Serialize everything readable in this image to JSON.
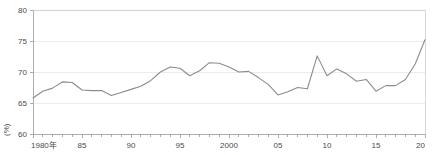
{
  "chart_data": {
    "type": "line",
    "title": "",
    "subtitle": "",
    "xlabel": "",
    "ylabel": "(%)",
    "ylim": [
      60,
      80
    ],
    "xlim": [
      1980,
      2020
    ],
    "grid": true,
    "legend": false,
    "legend_position": "none",
    "line_color": "#8c8c8c",
    "y_ticks": [
      60,
      65,
      70,
      75,
      80
    ],
    "y_tick_labels": [
      "60",
      "65",
      "70",
      "75",
      "80"
    ],
    "x_ticks": [
      1980,
      1985,
      1990,
      1995,
      2000,
      2005,
      2010,
      2015,
      2020
    ],
    "x_tick_labels": [
      "1980年",
      "85",
      "90",
      "95",
      "2000",
      "05",
      "10",
      "15",
      "20"
    ],
    "x_minor_tick_interval": 1,
    "x": [
      1980,
      1981,
      1982,
      1983,
      1984,
      1985,
      1986,
      1987,
      1988,
      1989,
      1990,
      1991,
      1992,
      1993,
      1994,
      1995,
      1996,
      1997,
      1998,
      1999,
      2000,
      2001,
      2002,
      2003,
      2004,
      2005,
      2006,
      2007,
      2008,
      2009,
      2010,
      2011,
      2012,
      2013,
      2014,
      2015,
      2016,
      2017,
      2018,
      2019,
      2020
    ],
    "series": [
      {
        "name": "値",
        "values": [
          65.8,
          66.9,
          67.4,
          68.4,
          68.3,
          67.1,
          67.0,
          67.0,
          66.2,
          66.7,
          67.2,
          67.7,
          68.6,
          70.0,
          70.8,
          70.6,
          69.4,
          70.2,
          71.5,
          71.4,
          70.8,
          70.0,
          70.1,
          69.1,
          68.0,
          66.3,
          66.8,
          67.5,
          67.3,
          72.6,
          69.4,
          70.5,
          69.7,
          68.5,
          68.8,
          66.9,
          67.8,
          67.8,
          68.8,
          71.3,
          75.2
        ]
      }
    ]
  },
  "axis": {
    "unit_label": "(%)"
  }
}
